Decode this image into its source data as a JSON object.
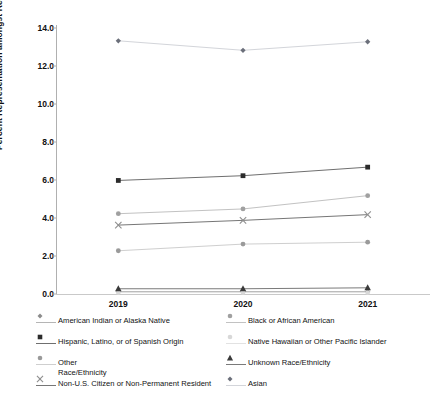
{
  "chart_data": {
    "type": "line",
    "title": "",
    "xlabel": "",
    "ylabel": "Percent Representation amongst Residents",
    "categories": [
      "2019",
      "2020",
      "2021"
    ],
    "x": [
      2019,
      2020,
      2021
    ],
    "ylim": [
      0.0,
      14.0
    ],
    "ytick_labels": [
      "0.0",
      "2.0",
      "4.0",
      "6.0",
      "8.0",
      "10.0",
      "12.0",
      "14.0"
    ],
    "ytick_values": [
      0.0,
      2.0,
      4.0,
      6.0,
      8.0,
      10.0,
      12.0,
      14.0
    ],
    "grid": false,
    "legend_position": "bottom",
    "series": [
      {
        "name": "American Indian or Alaska Native",
        "values": [
          0.1,
          0.1,
          0.1
        ],
        "marker": "diamond",
        "color": "#8c8c8c",
        "line_color": "#b5b5b5"
      },
      {
        "name": "Black or African American",
        "values": [
          4.2,
          4.45,
          5.15
        ],
        "marker": "circle",
        "color": "#a0a0a0",
        "line_color": "#c2c2c2"
      },
      {
        "name": "Hispanic, Latino, or of Spanish Origin",
        "values": [
          5.95,
          6.2,
          6.65
        ],
        "marker": "square",
        "color": "#2b2b2b",
        "line_color": "#6f6f6f"
      },
      {
        "name": "Native Hawaiian or Other Pacific Islander",
        "values": [
          0.05,
          0.05,
          0.05
        ],
        "marker": "circle",
        "color": "#d8d8d8",
        "line_color": "#e2e2e2"
      },
      {
        "name": "Other\nRace/Ethnicity",
        "values": [
          2.25,
          2.6,
          2.7
        ],
        "marker": "circle",
        "color": "#9a9a9a",
        "line_color": "#cfcfcf"
      },
      {
        "name": "Unknown Race/Ethnicity",
        "values": [
          0.25,
          0.25,
          0.3
        ],
        "marker": "triangle",
        "color": "#3a3a3a",
        "line_color": "#7a7a7a"
      },
      {
        "name": "Non-U.S. Citizen or Non-Permanent Resident",
        "values": [
          3.6,
          3.85,
          4.15
        ],
        "marker": "x",
        "color": "#8e8e8e",
        "line_color": "#767676"
      },
      {
        "name": "Asian",
        "values": [
          13.3,
          12.8,
          13.25
        ],
        "marker": "diamond",
        "color": "#6b6f7a",
        "line_color": "#d3d5da"
      }
    ]
  }
}
